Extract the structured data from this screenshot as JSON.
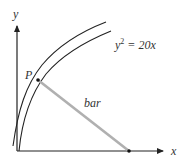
{
  "diagram": {
    "axes": {
      "x_label": "x",
      "y_label": "y"
    },
    "curve": {
      "equation_lhs": "y",
      "equation_exp": "2",
      "equation_rhs": " = 20x"
    },
    "point": {
      "label": "P"
    },
    "bar": {
      "label": "bar"
    },
    "colors": {
      "line": "#222222",
      "bar": "#b0b0b0",
      "text": "#333333"
    }
  }
}
